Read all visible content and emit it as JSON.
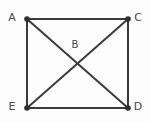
{
  "diagram": {
    "type": "graph-diagram",
    "background_color": "#fdfdfd",
    "stroke_color": "#3b3b3b",
    "vertex_color": "#2e2e2e",
    "label_color": "#4a4a4a",
    "stroke_width": 2,
    "vertex_radius": 2.8,
    "vertices": [
      {
        "id": "A",
        "label": "A",
        "x": 27,
        "y": 19,
        "has_dot": true,
        "label_x": 12,
        "label_y": 21
      },
      {
        "id": "C",
        "label": "C",
        "x": 128,
        "y": 19,
        "has_dot": true,
        "label_x": 138,
        "label_y": 21
      },
      {
        "id": "E",
        "label": "E",
        "x": 27,
        "y": 108,
        "has_dot": true,
        "label_x": 12,
        "label_y": 110
      },
      {
        "id": "D",
        "label": "D",
        "x": 128,
        "y": 108,
        "has_dot": true,
        "label_x": 138,
        "label_y": 110
      },
      {
        "id": "B",
        "label": "B",
        "x": 78,
        "y": 63,
        "has_dot": false,
        "label_x": 75,
        "label_y": 48
      }
    ],
    "edges": [
      {
        "id": "A-C",
        "from": "A",
        "to": "C",
        "x1": 27,
        "y1": 19,
        "x2": 128,
        "y2": 19
      },
      {
        "id": "A-E",
        "from": "A",
        "to": "E",
        "x1": 27,
        "y1": 19,
        "x2": 27,
        "y2": 108
      },
      {
        "id": "C-D",
        "from": "C",
        "to": "D",
        "x1": 128,
        "y1": 19,
        "x2": 128,
        "y2": 108
      },
      {
        "id": "E-D",
        "from": "E",
        "to": "D",
        "x1": 27,
        "y1": 108,
        "x2": 128,
        "y2": 108
      },
      {
        "id": "A-D",
        "from": "A",
        "to": "D",
        "x1": 27,
        "y1": 19,
        "x2": 128,
        "y2": 108
      },
      {
        "id": "E-C",
        "from": "E",
        "to": "C",
        "x1": 27,
        "y1": 108,
        "x2": 128,
        "y2": 19
      }
    ]
  }
}
